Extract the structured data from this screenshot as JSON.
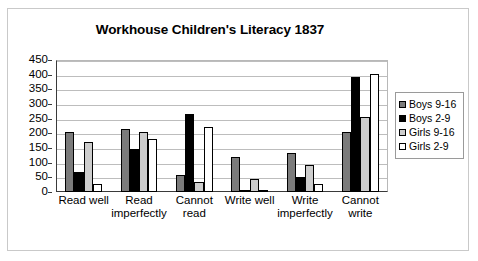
{
  "chart_data": {
    "type": "bar",
    "title": "Workhouse Children's Literacy 1837",
    "xlabel": "",
    "ylabel": "",
    "ylim": [
      0,
      450
    ],
    "ytick_step": 50,
    "yticks": [
      "0",
      "50",
      "100",
      "150",
      "200",
      "250",
      "300",
      "350",
      "400",
      "450"
    ],
    "grid": true,
    "legend_position": "right",
    "categories": [
      "Read well",
      "Read\nimperfectly",
      "Cannot\nread",
      "Write well",
      "Write\nimperfectly",
      "Cannot\nwrite"
    ],
    "series": [
      {
        "name": "Boys 9-16",
        "color": "#7b7b7b",
        "values": [
          205,
          215,
          58,
          118,
          133,
          205
        ]
      },
      {
        "name": "Boys 2-9",
        "color": "#000000",
        "values": [
          68,
          147,
          265,
          3,
          50,
          393
        ]
      },
      {
        "name": "Girls 9-16",
        "color": "#cdcdcd",
        "values": [
          172,
          205,
          34,
          43,
          91,
          255
        ]
      },
      {
        "name": "Girls 2-9",
        "color": "#ffffff",
        "values": [
          28,
          182,
          222,
          0,
          26,
          402
        ]
      }
    ]
  }
}
